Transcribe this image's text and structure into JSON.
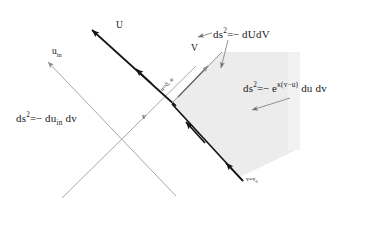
{
  "figure": {
    "type": "spacetime-penrose-diagram",
    "background_color": "#ffffff",
    "shaded_region_color": "#ececec",
    "line_color_thin": "#9a9a9a",
    "line_color_thick": "#1a1a1a"
  },
  "axes": {
    "u_axis_label": "U",
    "u_in_axis_label": "u",
    "u_in_axis_sub": "in",
    "v_axis_label": "V",
    "v_inner_label": "v"
  },
  "boundaries": {
    "horizon_label_main": "u=0",
    "horizon_label_sep": ",",
    "horizon_label_inf": "∞",
    "bottom_label_main": "v=v",
    "bottom_label_sub": "0"
  },
  "formulas": {
    "left": {
      "ds": "ds",
      "exp": "2",
      "eq": "=",
      "minus": "−",
      "body_du": "du",
      "body_sub": "in",
      "body_dv": "dv"
    },
    "top": {
      "ds": "ds",
      "exp": "2",
      "eq": "=",
      "minus": "−",
      "body": "dUdV"
    },
    "right": {
      "ds": "ds",
      "exp": "2",
      "eq": "=",
      "minus": "−",
      "e": "e",
      "kappa": "κ",
      "arg": "(v−u)",
      "tail": "du  dv"
    }
  }
}
